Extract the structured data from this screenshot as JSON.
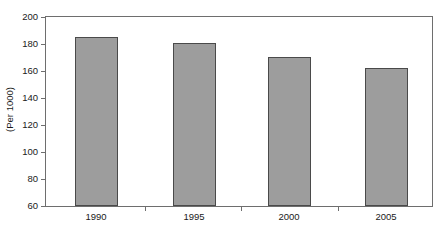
{
  "chart_data": {
    "type": "bar",
    "title": "",
    "subtitle": "",
    "xlabel": "",
    "ylabel": "(Per 1000)",
    "categories": [
      "1990",
      "1995",
      "2000",
      "2005"
    ],
    "values": [
      185,
      181,
      170,
      162
    ],
    "series": [
      {
        "name": "",
        "values": [
          185,
          181,
          170,
          162
        ]
      }
    ],
    "ylim": [
      60,
      200
    ],
    "ytick_step": 20,
    "ytick_labels": [
      "200",
      "180",
      "160",
      "140",
      "120",
      "100",
      "80",
      "60"
    ],
    "ytick_values": [
      200,
      180,
      160,
      140,
      120,
      100,
      80,
      60
    ],
    "grid": false,
    "legend": false,
    "legend_position": "none",
    "bar_fill_color": "#9d9d9d",
    "bar_border_color": "#4a4a4a",
    "axis_color": "#6e6e6e",
    "text_color": "#1a1a1a",
    "background_color": "#ffffff"
  }
}
